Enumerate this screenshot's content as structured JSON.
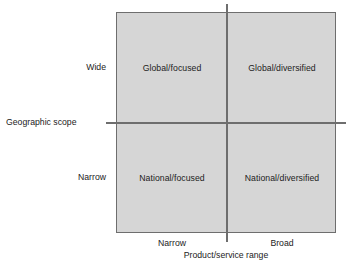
{
  "chart_data": {
    "type": "table",
    "title": "",
    "xlabel": "Product/service range",
    "ylabel": "Geographic scope",
    "x_categories": [
      "Narrow",
      "Broad"
    ],
    "y_categories": [
      "Wide",
      "Narrow"
    ],
    "grid": true,
    "legend": "none",
    "cells": [
      {
        "row": "Wide",
        "col": "Narrow",
        "label": "Global/focused"
      },
      {
        "row": "Wide",
        "col": "Broad",
        "label": "Global/diversified"
      },
      {
        "row": "Narrow",
        "col": "Narrow",
        "label": "National/focused"
      },
      {
        "row": "Narrow",
        "col": "Broad",
        "label": "National/diversified"
      }
    ],
    "colors": {
      "fill": "#d6d6d6",
      "border": "#6e6e6e",
      "text": "#222222",
      "background": "#ffffff"
    }
  },
  "axes": {
    "y": {
      "title": "Geographic scope",
      "ticks": [
        "Wide",
        "Narrow"
      ]
    },
    "x": {
      "title": "Product/service range",
      "ticks": [
        "Narrow",
        "Broad"
      ]
    }
  },
  "quadrants": {
    "top_left": "Global/focused",
    "top_right": "Global/diversified",
    "bottom_left": "National/focused",
    "bottom_right": "National/diversified"
  }
}
